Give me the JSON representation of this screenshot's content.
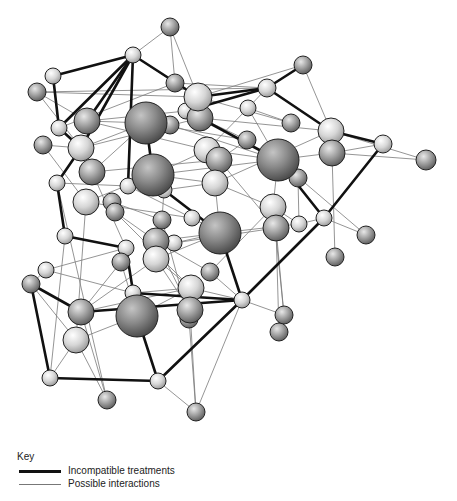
{
  "diagram": {
    "type": "network",
    "colors": {
      "thick_edge": "#111111",
      "thin_edge": "#7a7a7a",
      "sphere_light": "#e4e4e4",
      "sphere_mid": "#a8a8a8",
      "sphere_dark": "#8a8a8a",
      "sphere_outline": "#222222"
    },
    "nodes": [
      {
        "id": "n1",
        "x": 170,
        "y": 27,
        "r": 9,
        "shade": "mid"
      },
      {
        "id": "n2",
        "x": 133,
        "y": 55,
        "r": 8,
        "shade": "light"
      },
      {
        "id": "n3",
        "x": 53,
        "y": 76,
        "r": 8,
        "shade": "light"
      },
      {
        "id": "n4",
        "x": 37,
        "y": 92,
        "r": 9,
        "shade": "mid"
      },
      {
        "id": "n5",
        "x": 175,
        "y": 83,
        "r": 9,
        "shade": "mid"
      },
      {
        "id": "n6",
        "x": 198,
        "y": 97,
        "r": 14,
        "shade": "light"
      },
      {
        "id": "n7",
        "x": 146,
        "y": 123,
        "r": 21,
        "shade": "dark"
      },
      {
        "id": "n8",
        "x": 170,
        "y": 125,
        "r": 9,
        "shade": "mid"
      },
      {
        "id": "n9",
        "x": 186,
        "y": 111,
        "r": 8,
        "shade": "light"
      },
      {
        "id": "n10",
        "x": 200,
        "y": 118,
        "r": 13,
        "shade": "mid"
      },
      {
        "id": "n11",
        "x": 87,
        "y": 121,
        "r": 13,
        "shade": "mid"
      },
      {
        "id": "n12",
        "x": 59,
        "y": 128,
        "r": 8,
        "shade": "light"
      },
      {
        "id": "n13",
        "x": 43,
        "y": 145,
        "r": 9,
        "shade": "mid"
      },
      {
        "id": "n14",
        "x": 81,
        "y": 148,
        "r": 13,
        "shade": "light"
      },
      {
        "id": "n15",
        "x": 92,
        "y": 172,
        "r": 13,
        "shade": "mid"
      },
      {
        "id": "n16",
        "x": 153,
        "y": 175,
        "r": 21,
        "shade": "dark"
      },
      {
        "id": "n17",
        "x": 164,
        "y": 190,
        "r": 8,
        "shade": "light"
      },
      {
        "id": "n18",
        "x": 128,
        "y": 186,
        "r": 8,
        "shade": "light"
      },
      {
        "id": "n19",
        "x": 57,
        "y": 183,
        "r": 8,
        "shade": "light"
      },
      {
        "id": "n20",
        "x": 86,
        "y": 202,
        "r": 13,
        "shade": "light"
      },
      {
        "id": "n21",
        "x": 112,
        "y": 202,
        "r": 9,
        "shade": "mid"
      },
      {
        "id": "n22",
        "x": 115,
        "y": 212,
        "r": 9,
        "shade": "mid"
      },
      {
        "id": "n23",
        "x": 65,
        "y": 236,
        "r": 8,
        "shade": "light"
      },
      {
        "id": "n24",
        "x": 267,
        "y": 88,
        "r": 9,
        "shade": "light"
      },
      {
        "id": "n25",
        "x": 303,
        "y": 65,
        "r": 9,
        "shade": "mid"
      },
      {
        "id": "n26",
        "x": 248,
        "y": 108,
        "r": 8,
        "shade": "light"
      },
      {
        "id": "n27",
        "x": 291,
        "y": 123,
        "r": 9,
        "shade": "mid"
      },
      {
        "id": "n28",
        "x": 331,
        "y": 131,
        "r": 13,
        "shade": "light"
      },
      {
        "id": "n29",
        "x": 332,
        "y": 153,
        "r": 13,
        "shade": "mid"
      },
      {
        "id": "n30",
        "x": 383,
        "y": 144,
        "r": 9,
        "shade": "light"
      },
      {
        "id": "n31",
        "x": 426,
        "y": 160,
        "r": 10,
        "shade": "mid"
      },
      {
        "id": "n32",
        "x": 278,
        "y": 160,
        "r": 21,
        "shade": "dark"
      },
      {
        "id": "n33",
        "x": 298,
        "y": 178,
        "r": 9,
        "shade": "mid"
      },
      {
        "id": "n34",
        "x": 247,
        "y": 140,
        "r": 9,
        "shade": "mid"
      },
      {
        "id": "n35",
        "x": 207,
        "y": 150,
        "r": 13,
        "shade": "light"
      },
      {
        "id": "n36",
        "x": 219,
        "y": 160,
        "r": 13,
        "shade": "mid"
      },
      {
        "id": "n37",
        "x": 215,
        "y": 183,
        "r": 13,
        "shade": "light"
      },
      {
        "id": "n38",
        "x": 273,
        "y": 207,
        "r": 13,
        "shade": "light"
      },
      {
        "id": "n39",
        "x": 276,
        "y": 228,
        "r": 13,
        "shade": "mid"
      },
      {
        "id": "n40",
        "x": 299,
        "y": 224,
        "r": 8,
        "shade": "light"
      },
      {
        "id": "n41",
        "x": 324,
        "y": 218,
        "r": 8,
        "shade": "light"
      },
      {
        "id": "n42",
        "x": 366,
        "y": 235,
        "r": 9,
        "shade": "mid"
      },
      {
        "id": "n43",
        "x": 335,
        "y": 257,
        "r": 9,
        "shade": "mid"
      },
      {
        "id": "n44",
        "x": 220,
        "y": 233,
        "r": 21,
        "shade": "dark"
      },
      {
        "id": "n45",
        "x": 192,
        "y": 218,
        "r": 8,
        "shade": "light"
      },
      {
        "id": "n46",
        "x": 162,
        "y": 220,
        "r": 9,
        "shade": "mid"
      },
      {
        "id": "n47",
        "x": 156,
        "y": 241,
        "r": 13,
        "shade": "mid"
      },
      {
        "id": "n48",
        "x": 174,
        "y": 243,
        "r": 8,
        "shade": "light"
      },
      {
        "id": "n49",
        "x": 156,
        "y": 259,
        "r": 13,
        "shade": "light"
      },
      {
        "id": "n50",
        "x": 126,
        "y": 248,
        "r": 8,
        "shade": "light"
      },
      {
        "id": "n51",
        "x": 121,
        "y": 262,
        "r": 9,
        "shade": "mid"
      },
      {
        "id": "n52",
        "x": 46,
        "y": 270,
        "r": 8,
        "shade": "light"
      },
      {
        "id": "n53",
        "x": 31,
        "y": 284,
        "r": 9,
        "shade": "mid"
      },
      {
        "id": "n54",
        "x": 81,
        "y": 312,
        "r": 13,
        "shade": "mid"
      },
      {
        "id": "n55",
        "x": 76,
        "y": 340,
        "r": 13,
        "shade": "light"
      },
      {
        "id": "n56",
        "x": 137,
        "y": 316,
        "r": 21,
        "shade": "dark"
      },
      {
        "id": "n57",
        "x": 133,
        "y": 293,
        "r": 8,
        "shade": "light"
      },
      {
        "id": "n58",
        "x": 191,
        "y": 288,
        "r": 13,
        "shade": "light"
      },
      {
        "id": "n59",
        "x": 190,
        "y": 310,
        "r": 13,
        "shade": "mid"
      },
      {
        "id": "n60",
        "x": 189,
        "y": 319,
        "r": 9,
        "shade": "mid"
      },
      {
        "id": "n61",
        "x": 210,
        "y": 272,
        "r": 9,
        "shade": "mid"
      },
      {
        "id": "n62",
        "x": 242,
        "y": 300,
        "r": 8,
        "shade": "light"
      },
      {
        "id": "n63",
        "x": 284,
        "y": 315,
        "r": 9,
        "shade": "mid"
      },
      {
        "id": "n64",
        "x": 279,
        "y": 332,
        "r": 9,
        "shade": "mid"
      },
      {
        "id": "n65",
        "x": 50,
        "y": 378,
        "r": 8,
        "shade": "light"
      },
      {
        "id": "n66",
        "x": 158,
        "y": 381,
        "r": 8,
        "shade": "light"
      },
      {
        "id": "n67",
        "x": 107,
        "y": 400,
        "r": 9,
        "shade": "mid"
      },
      {
        "id": "n68",
        "x": 196,
        "y": 412,
        "r": 9,
        "shade": "mid"
      }
    ],
    "thick_edges": [
      [
        "n2",
        "n3"
      ],
      [
        "n2",
        "n12"
      ],
      [
        "n2",
        "n11"
      ],
      [
        "n2",
        "n14"
      ],
      [
        "n2",
        "n18"
      ],
      [
        "n2",
        "n6"
      ],
      [
        "n3",
        "n12"
      ],
      [
        "n12",
        "n14"
      ],
      [
        "n14",
        "n19"
      ],
      [
        "n19",
        "n23"
      ],
      [
        "n23",
        "n50"
      ],
      [
        "n6",
        "n24"
      ],
      [
        "n24",
        "n25"
      ],
      [
        "n24",
        "n28"
      ],
      [
        "n28",
        "n30"
      ],
      [
        "n30",
        "n41"
      ],
      [
        "n10",
        "n32"
      ],
      [
        "n32",
        "n41"
      ],
      [
        "n41",
        "n62"
      ],
      [
        "n17",
        "n44"
      ],
      [
        "n44",
        "n62"
      ],
      [
        "n50",
        "n56"
      ],
      [
        "n57",
        "n62"
      ],
      [
        "n53",
        "n54"
      ],
      [
        "n54",
        "n62"
      ],
      [
        "n53",
        "n65"
      ],
      [
        "n65",
        "n66"
      ],
      [
        "n66",
        "n62"
      ],
      [
        "n56",
        "n66"
      ],
      [
        "n7",
        "n16"
      ],
      [
        "n9",
        "n24"
      ]
    ],
    "thin_edges": [
      [
        "n1",
        "n2"
      ],
      [
        "n1",
        "n5"
      ],
      [
        "n1",
        "n6"
      ],
      [
        "n2",
        "n5"
      ],
      [
        "n4",
        "n6"
      ],
      [
        "n4",
        "n11"
      ],
      [
        "n4",
        "n14"
      ],
      [
        "n6",
        "n25"
      ],
      [
        "n24",
        "n26"
      ],
      [
        "n25",
        "n28"
      ],
      [
        "n25",
        "n24"
      ],
      [
        "n26",
        "n27"
      ],
      [
        "n26",
        "n32"
      ],
      [
        "n28",
        "n31"
      ],
      [
        "n29",
        "n31"
      ],
      [
        "n29",
        "n30"
      ],
      [
        "n32",
        "n42"
      ],
      [
        "n33",
        "n40"
      ],
      [
        "n32",
        "n38"
      ],
      [
        "n38",
        "n40"
      ],
      [
        "n40",
        "n41"
      ],
      [
        "n41",
        "n42"
      ],
      [
        "n43",
        "n29"
      ],
      [
        "n39",
        "n63"
      ],
      [
        "n39",
        "n64"
      ],
      [
        "n38",
        "n63"
      ],
      [
        "n62",
        "n63"
      ],
      [
        "n13",
        "n14"
      ],
      [
        "n13",
        "n20"
      ],
      [
        "n19",
        "n18"
      ],
      [
        "n11",
        "n7"
      ],
      [
        "n11",
        "n35"
      ],
      [
        "n14",
        "n7"
      ],
      [
        "n14",
        "n10"
      ],
      [
        "n15",
        "n7"
      ],
      [
        "n15",
        "n36"
      ],
      [
        "n20",
        "n16"
      ],
      [
        "n20",
        "n45"
      ],
      [
        "n18",
        "n16"
      ],
      [
        "n16",
        "n35"
      ],
      [
        "n16",
        "n37"
      ],
      [
        "n17",
        "n37"
      ],
      [
        "n35",
        "n26"
      ],
      [
        "n36",
        "n34"
      ],
      [
        "n37",
        "n38"
      ],
      [
        "n37",
        "n44"
      ],
      [
        "n45",
        "n44"
      ],
      [
        "n46",
        "n17"
      ],
      [
        "n47",
        "n44"
      ],
      [
        "n48",
        "n44"
      ],
      [
        "n49",
        "n44"
      ],
      [
        "n49",
        "n58"
      ],
      [
        "n49",
        "n54"
      ],
      [
        "n50",
        "n52"
      ],
      [
        "n52",
        "n53"
      ],
      [
        "n53",
        "n55"
      ],
      [
        "n54",
        "n58"
      ],
      [
        "n55",
        "n56"
      ],
      [
        "n55",
        "n67"
      ],
      [
        "n54",
        "n67"
      ],
      [
        "n56",
        "n58"
      ],
      [
        "n57",
        "n58"
      ],
      [
        "n58",
        "n62"
      ],
      [
        "n59",
        "n68"
      ],
      [
        "n60",
        "n68"
      ],
      [
        "n61",
        "n62"
      ],
      [
        "n61",
        "n38"
      ],
      [
        "n66",
        "n68"
      ],
      [
        "n62",
        "n68"
      ],
      [
        "n65",
        "n55"
      ],
      [
        "n22",
        "n47"
      ],
      [
        "n21",
        "n46"
      ],
      [
        "n23",
        "n65"
      ],
      [
        "n19",
        "n67"
      ],
      [
        "n20",
        "n55"
      ],
      [
        "n15",
        "n50"
      ],
      [
        "n5",
        "n24"
      ],
      [
        "n7",
        "n34"
      ],
      [
        "n8",
        "n32"
      ],
      [
        "n10",
        "n28"
      ],
      [
        "n6",
        "n27"
      ],
      [
        "n9",
        "n34"
      ],
      [
        "n35",
        "n32"
      ],
      [
        "n36",
        "n39"
      ],
      [
        "n47",
        "n61"
      ],
      [
        "n48",
        "n39"
      ],
      [
        "n44",
        "n40"
      ],
      [
        "n11",
        "n9"
      ],
      [
        "n12",
        "n5"
      ],
      [
        "n4",
        "n24"
      ],
      [
        "n16",
        "n29"
      ],
      [
        "n37",
        "n28"
      ],
      [
        "n18",
        "n45"
      ],
      [
        "n22",
        "n58"
      ],
      [
        "n46",
        "n60"
      ],
      [
        "n51",
        "n56"
      ],
      [
        "n51",
        "n54"
      ],
      [
        "n52",
        "n57"
      ],
      [
        "n49",
        "n59"
      ],
      [
        "n47",
        "n59"
      ]
    ]
  },
  "legend": {
    "title": "Key",
    "items": [
      {
        "label": "Incompatible treatments",
        "style": "thick"
      },
      {
        "label": "Possible interactions",
        "style": "thin"
      }
    ]
  }
}
